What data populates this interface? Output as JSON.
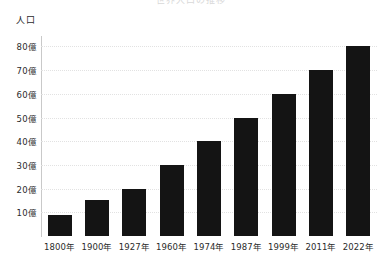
{
  "chart_data": {
    "type": "bar",
    "title": "世界人口の推移",
    "xlabel": "",
    "ylabel": "人口",
    "categories": [
      "1800年",
      "1900年",
      "1927年",
      "1960年",
      "1974年",
      "1987年",
      "1999年",
      "2011年",
      "2022年"
    ],
    "values": [
      9,
      15,
      20,
      30,
      40,
      50,
      60,
      70,
      80
    ],
    "unit": "億",
    "ylim": [
      0,
      84
    ],
    "yticks": [
      10,
      20,
      30,
      40,
      50,
      60,
      70,
      80
    ],
    "ytick_labels": [
      "10億",
      "20億",
      "30億",
      "40億",
      "50億",
      "60億",
      "70億",
      "80億"
    ],
    "grid": true,
    "legend": false,
    "bar_color": "#141414",
    "gridline_color": "#e2e2e2",
    "axis_color": "#c9c9c9"
  }
}
